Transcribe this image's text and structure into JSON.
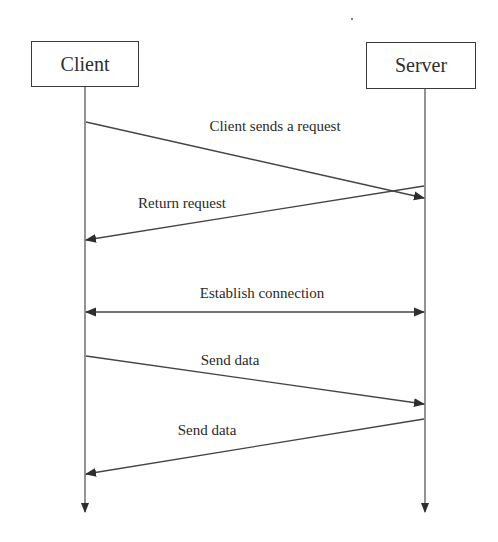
{
  "diagram": {
    "type": "sequence-diagram",
    "colors": {
      "line": "#4a4a4a",
      "text": "#2a2a2a",
      "background": "#ffffff"
    },
    "actors": [
      {
        "id": "client",
        "label": "Client"
      },
      {
        "id": "server",
        "label": "Server"
      }
    ],
    "messages": [
      {
        "from": "client",
        "to": "server",
        "label": "Client sends a request"
      },
      {
        "from": "server",
        "to": "client",
        "label": "Return request"
      },
      {
        "from": "client",
        "to": "server",
        "bidirectional": true,
        "label": "Establish connection"
      },
      {
        "from": "client",
        "to": "server",
        "label": "Send data"
      },
      {
        "from": "server",
        "to": "client",
        "label": "Send data"
      }
    ]
  }
}
